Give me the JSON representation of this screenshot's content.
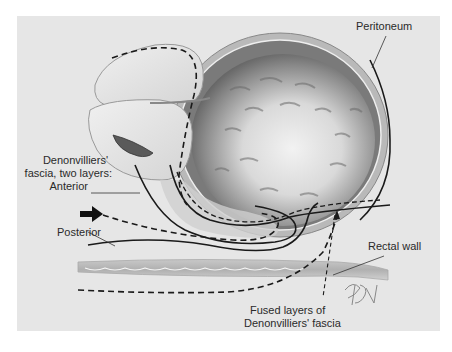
{
  "figure": {
    "background": "#e6e6e6",
    "labels": {
      "peritoneum": "Peritoneum",
      "denonvilliers_line1": "Denonvilliers'",
      "denonvilliers_line2": "fascia, two layers:",
      "denonvilliers_line3": "Anterior",
      "posterior": "Posterior",
      "rectal_wall": "Rectal wall",
      "fused_line1": "Fused layers of",
      "fused_line2": "Denonvilliers' fascia"
    },
    "signature": "BJ",
    "icons": {
      "arrow": "black-arrow-pointing-right"
    }
  }
}
